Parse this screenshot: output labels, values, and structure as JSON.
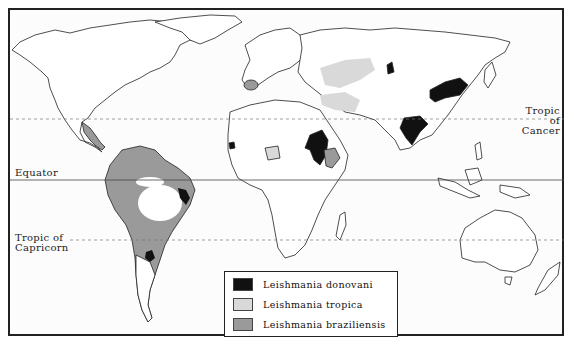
{
  "map": {
    "title": "",
    "colors": {
      "donovani": "#111111",
      "tropica": "#d9d9d9",
      "braziliensis": "#9a9a9a",
      "land_outline": "#222222",
      "background": "#fcfcfc"
    },
    "reference_lines": [
      {
        "id": "tropic-of-cancer",
        "label_line1": "Tropic of",
        "label_line2": "Cancer",
        "style": "dashed"
      },
      {
        "id": "equator",
        "label": "Equator",
        "style": "solid"
      },
      {
        "id": "tropic-of-capricorn",
        "label_line1": "Tropic of",
        "label_line2": "Capricorn",
        "style": "dashed"
      }
    ],
    "legend": {
      "items": [
        {
          "label": "Leishmania donovani",
          "fill": "black"
        },
        {
          "label": "Leishmania tropica",
          "fill": "light-gray"
        },
        {
          "label": "Leishmania braziliensis",
          "fill": "medium-gray"
        }
      ]
    }
  }
}
